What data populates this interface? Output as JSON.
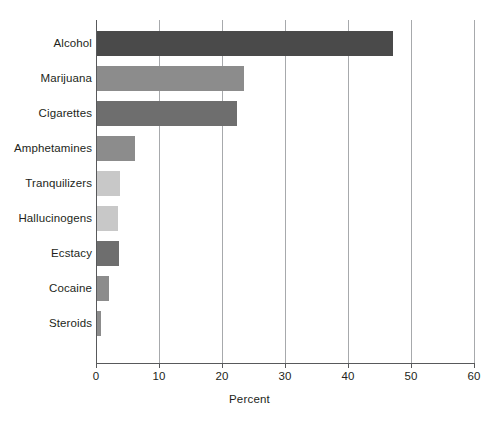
{
  "chart_data": {
    "type": "bar",
    "orientation": "horizontal",
    "title": "",
    "subtitle": "",
    "xlabel": "Percent",
    "ylabel": "",
    "xlim": [
      0,
      60
    ],
    "xticks": [
      0,
      10,
      20,
      30,
      40,
      50,
      60
    ],
    "xtick_labels": [
      "0",
      "10",
      "20",
      "30",
      "40",
      "50",
      "60"
    ],
    "grid": "vertical",
    "legend": "none",
    "categories": [
      "Alcohol",
      "Marijuana",
      "Cigarettes",
      "Amphetamines",
      "Tranquilizers",
      "Hallucinogens",
      "Ecstacy",
      "Cocaine",
      "Steroids"
    ],
    "values": [
      47.0,
      23.4,
      22.3,
      6.0,
      3.6,
      3.4,
      3.5,
      1.9,
      0.6
    ],
    "bar_colors": [
      "#4a4a4a",
      "#8c8c8c",
      "#6e6e6e",
      "#8c8c8c",
      "#c8c8c8",
      "#c8c8c8",
      "#6e6e6e",
      "#8c8c8c",
      "#8c8c8c"
    ],
    "axis_color": "#58595b",
    "grid_color": "#a7a9ac",
    "text_color": "#231f20",
    "background": "#ffffff"
  }
}
